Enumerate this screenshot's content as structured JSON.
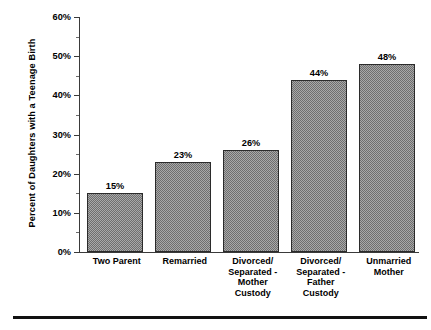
{
  "chart_data": {
    "type": "bar",
    "title": "",
    "xlabel": "",
    "ylabel": "Percent of Daughters with a Teenage Birth",
    "ylim": [
      0,
      60
    ],
    "y_tick_labels": [
      "60%",
      "50%",
      "40%",
      "30%",
      "20%",
      "10%",
      "0%"
    ],
    "y_tick_values": [
      60,
      50,
      40,
      30,
      20,
      10,
      0
    ],
    "y_minor_tick_values": [
      55,
      45,
      35,
      25,
      15,
      5
    ],
    "grid": false,
    "legend": null,
    "categories": [
      "Two Parent",
      "Remarried",
      "Divorced/ Separated - Mother Custody",
      "Divorced/ Separated - Father Custody",
      "Unmarried Mother"
    ],
    "category_lines": [
      [
        "Two Parent"
      ],
      [
        "Remarried"
      ],
      [
        "Divorced/",
        "Separated -",
        "Mother",
        "Custody"
      ],
      [
        "Divorced/",
        "Separated -",
        "Father",
        "Custody"
      ],
      [
        "Unmarried",
        "Mother"
      ]
    ],
    "values": [
      15,
      23,
      26,
      44,
      48
    ],
    "value_labels": [
      "15%",
      "23%",
      "26%",
      "44%",
      "48%"
    ],
    "colors": {
      "bar_fill": "#8a8a8a",
      "bar_border": "#2b2b2b",
      "axis": "#3a3a3a",
      "text": "#000000",
      "background": "#ffffff",
      "rule": "#111111"
    }
  }
}
